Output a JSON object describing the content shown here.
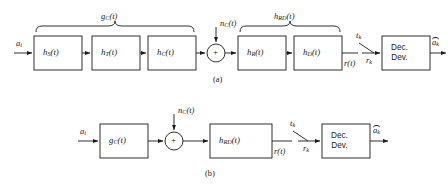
{
  "figure": {
    "type": "block-diagram",
    "line_color": "#1a1a1a",
    "background_color": "#ffffff",
    "subfigures": [
      {
        "caption": "(a)",
        "input_label": "a",
        "input_sub": "i",
        "blocks": [
          {
            "name": "shaping-filter",
            "h": "h",
            "sub": "S",
            "arg": "(t)"
          },
          {
            "name": "transmit-filter",
            "h": "h",
            "sub": "T",
            "arg": "(t)"
          },
          {
            "name": "channel-filter",
            "h": "h",
            "sub": "C",
            "arg": "(t)"
          },
          {
            "name": "receive-filter",
            "h": "h",
            "sub": "R",
            "arg": "(t)"
          },
          {
            "name": "detection-filter",
            "h": "h",
            "sub": "D",
            "arg": "(t)"
          }
        ],
        "brace_left": {
          "h": "g",
          "sub": "C",
          "arg": "(t)"
        },
        "brace_right": {
          "h": "h",
          "sub": "RD",
          "arg": "(t)"
        },
        "noise": {
          "h": "n",
          "sub": "C",
          "arg": "(t)"
        },
        "adder_symbol": "+",
        "signal_rt": {
          "h": "r",
          "arg": "(t)"
        },
        "sampler_time": {
          "h": "t",
          "sub": "k"
        },
        "sample_value": {
          "h": "r",
          "sub": "k"
        },
        "decision_device": {
          "line1": "Dec.",
          "line2": "Dev."
        },
        "output": {
          "h": "a",
          "sub": "k",
          "hat": true
        }
      },
      {
        "caption": "(b)",
        "input_label": "a",
        "input_sub": "i",
        "blocks": [
          {
            "name": "combined-transmit-channel",
            "h": "g",
            "sub": "C",
            "arg": "(t)"
          },
          {
            "name": "combined-receive-detect",
            "h": "h",
            "sub": "RD",
            "arg": "(t)"
          }
        ],
        "noise": {
          "h": "n",
          "sub": "C",
          "arg": "(t)"
        },
        "adder_symbol": "+",
        "signal_rt": {
          "h": "r",
          "arg": "(t)"
        },
        "sampler_time": {
          "h": "t",
          "sub": "k"
        },
        "sample_value": {
          "h": "r",
          "sub": "k"
        },
        "decision_device": {
          "line1": "Dec.",
          "line2": "Dev."
        },
        "output": {
          "h": "a",
          "sub": "k",
          "hat": true
        }
      }
    ]
  }
}
